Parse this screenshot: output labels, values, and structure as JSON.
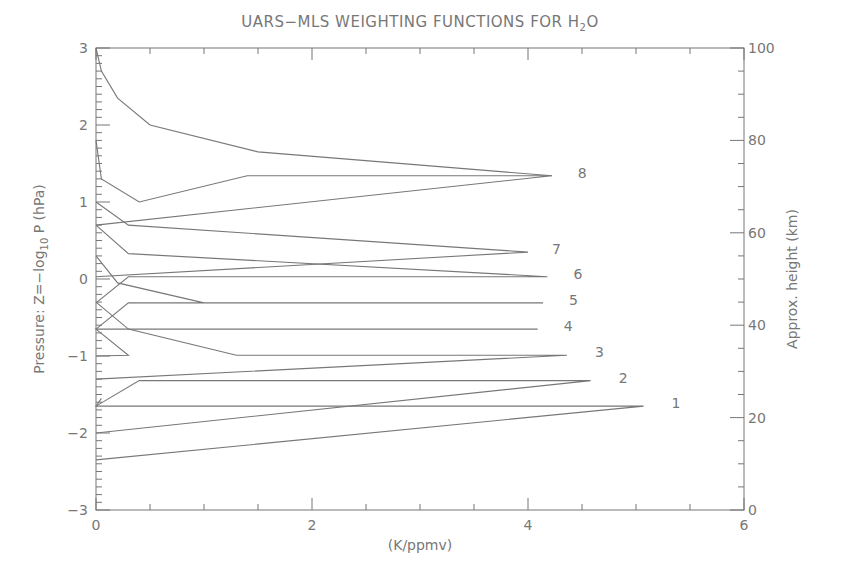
{
  "chart_data": {
    "type": "line",
    "title_main": "UARS−MLS WEIGHTING FUNCTIONS FOR H",
    "title_sub": "2",
    "title_end": "O",
    "xlabel": "(K/ppmv)",
    "ylabel": "Pressure: Z=−log10 P (hPa)",
    "ylabel_parts": {
      "pre": "Pressure: Z=−log",
      "sub": "10",
      "post": " P (hPa)"
    },
    "y2label": "Approx. height (km)",
    "xlim": [
      0,
      6
    ],
    "ylim": [
      -3,
      3
    ],
    "y2lim": [
      0,
      100
    ],
    "grid": false,
    "x_ticks": [
      {
        "v": 0,
        "label": "0"
      },
      {
        "v": 2,
        "label": "2"
      },
      {
        "v": 4,
        "label": "4"
      },
      {
        "v": 6,
        "label": "6"
      }
    ],
    "y_ticks": [
      {
        "v": 3,
        "label": "3"
      },
      {
        "v": 2,
        "label": "2"
      },
      {
        "v": 1,
        "label": "1"
      },
      {
        "v": 0,
        "label": "0"
      },
      {
        "v": -1,
        "label": "−1"
      },
      {
        "v": -2,
        "label": "−2"
      },
      {
        "v": -3,
        "label": "−3"
      }
    ],
    "y2_ticks": [
      {
        "v": 100,
        "label": "100"
      },
      {
        "v": 80,
        "label": "80"
      },
      {
        "v": 60,
        "label": "60"
      },
      {
        "v": 40,
        "label": "40"
      },
      {
        "v": 20,
        "label": "20"
      },
      {
        "v": 0,
        "label": "0"
      }
    ],
    "series": [
      {
        "name": "1",
        "peak_x": 5.07,
        "peak_z": -1.65,
        "points": [
          [
            0.0,
            -2.35
          ],
          [
            5.07,
            -1.65
          ],
          [
            0.0,
            -1.65
          ],
          [
            0.05,
            -1.55
          ]
        ]
      },
      {
        "name": "2",
        "peak_x": 4.58,
        "peak_z": -1.32,
        "points": [
          [
            0.0,
            -2.0
          ],
          [
            4.58,
            -1.32
          ],
          [
            0.4,
            -1.32
          ],
          [
            0.0,
            -1.65
          ]
        ]
      },
      {
        "name": "3",
        "peak_x": 4.36,
        "peak_z": -0.99,
        "points": [
          [
            0.0,
            -1.3
          ],
          [
            4.36,
            -0.99
          ],
          [
            1.3,
            -0.99
          ],
          [
            0.3,
            -0.65
          ],
          [
            0.0,
            -0.3
          ]
        ]
      },
      {
        "name": "4",
        "peak_x": 4.09,
        "peak_z": -0.65,
        "points": [
          [
            0.0,
            -1.0
          ],
          [
            0.3,
            -0.99
          ],
          [
            0.0,
            -0.65
          ],
          [
            0.3,
            -0.65
          ],
          [
            4.09,
            -0.65
          ],
          [
            1.0,
            -0.65
          ]
        ]
      },
      {
        "name": "5",
        "peak_x": 4.14,
        "peak_z": -0.31,
        "points": [
          [
            0.0,
            -0.65
          ],
          [
            0.3,
            -0.31
          ],
          [
            4.14,
            -0.31
          ],
          [
            1.0,
            -0.31
          ],
          [
            0.2,
            -0.05
          ],
          [
            0.0,
            0.3
          ]
        ]
      },
      {
        "name": "6",
        "peak_x": 4.18,
        "peak_z": 0.03,
        "points": [
          [
            0.0,
            -0.31
          ],
          [
            0.3,
            0.03
          ],
          [
            4.18,
            0.03
          ],
          [
            0.3,
            0.33
          ],
          [
            0.0,
            0.7
          ]
        ]
      },
      {
        "name": "7",
        "peak_x": 4.0,
        "peak_z": 0.35,
        "points": [
          [
            0.0,
            0.03
          ],
          [
            4.0,
            0.35
          ],
          [
            0.3,
            0.7
          ],
          [
            0.0,
            1.0
          ]
        ]
      },
      {
        "name": "8",
        "peak_x": 4.22,
        "peak_z": 1.34,
        "points": [
          [
            0.0,
            0.7
          ],
          [
            4.22,
            1.34
          ],
          [
            1.4,
            1.34
          ],
          [
            0.4,
            1.0
          ],
          [
            0.05,
            1.3
          ],
          [
            0.0,
            1.8
          ]
        ]
      },
      {
        "name": "top",
        "peak_x": null,
        "peak_z": null,
        "points": [
          [
            4.22,
            1.34
          ],
          [
            1.5,
            1.65
          ],
          [
            0.5,
            2.0
          ],
          [
            0.2,
            2.35
          ],
          [
            0.05,
            2.7
          ],
          [
            0.0,
            3.0
          ]
        ]
      }
    ]
  }
}
